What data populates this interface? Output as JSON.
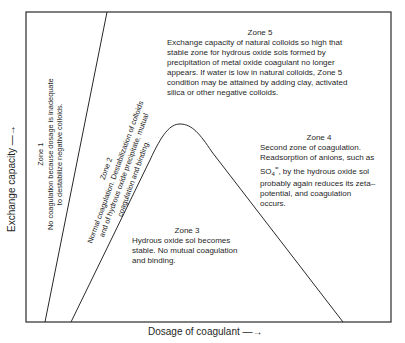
{
  "axes": {
    "x_label": "Dosage of coagulant —→",
    "y_label": "Exchange capacity —→"
  },
  "zones": [
    {
      "title": "Zone 1",
      "lines": [
        "No coagulation because dosage is inadequate",
        "to destabilize negative colloids."
      ]
    },
    {
      "title": "Zone 2",
      "lines": [
        "Normal coagulation. Destabilization of colloids",
        "and of hydrous oxide precipitate, mutual",
        "coagulation and binding."
      ]
    },
    {
      "title": "Zone 3",
      "text": "Hydrous oxide sol becomes stable. No mutual coagulation and binding."
    },
    {
      "title": "Zone 4",
      "text_before": "Second zone of coagulation. Readsorption of anions, such as SO",
      "subscript": "4",
      "superscript": "=",
      "text_after": ", by the hydrous oxide sol probably again reduces its zeta–potential, and coagulation occurs."
    },
    {
      "title": "Zone 5",
      "text": "Exchange capacity of natural colloids so high that stable zone for hydrous oxide sols formed by precipitation of metal oxide coagulant no longer appears. If water is low in natural colloids, Zone 5 condition may be attained by adding clay, activated silica or other negative colloids."
    }
  ],
  "colors": {
    "line": "#2a2a2a",
    "text": "#1f1f1f",
    "background": "#ffffff"
  }
}
